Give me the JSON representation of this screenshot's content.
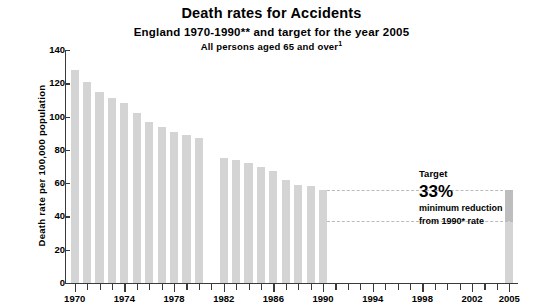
{
  "chart_data": {
    "type": "bar",
    "title": "Death rates for Accidents",
    "subtitle": "England 1970-1990** and target for the year 2005",
    "subtitle2": "All persons aged 65 and over",
    "subtitle2_superscript": "1",
    "xlabel": "",
    "ylabel": "Death rate per 100,000 population",
    "ylim": [
      0,
      140
    ],
    "y_ticks": [
      0,
      20,
      40,
      60,
      80,
      100,
      120,
      140
    ],
    "xlim": [
      1969.3,
      2005.7
    ],
    "x_tick_labels": [
      "1970",
      "1974",
      "1978",
      "1982",
      "1986",
      "1990",
      "1994",
      "1998",
      "2002",
      "2005"
    ],
    "x_tick_label_years": [
      1970,
      1974,
      1978,
      1982,
      1986,
      1990,
      1994,
      1998,
      2002,
      2005
    ],
    "grid": false,
    "legend": "none",
    "bar_color": "#d4d4d4",
    "target_bar_reduction_color": "#bdbdbd",
    "axis_color": "#3a3a3a",
    "dash_color": "#bbbbbb",
    "categories": [
      1970,
      1971,
      1972,
      1973,
      1974,
      1975,
      1976,
      1977,
      1978,
      1979,
      1980,
      1982,
      1983,
      1984,
      1985,
      1986,
      1987,
      1988,
      1989,
      1990,
      2005
    ],
    "values": [
      128,
      121,
      115,
      111,
      108,
      102,
      97,
      94,
      91,
      89,
      87,
      75,
      74,
      72,
      70,
      67,
      62,
      59,
      58,
      56,
      37.5
    ],
    "data_break_after_year": 1980,
    "missing_years": [
      1981
    ],
    "target_year": 2005,
    "target_baseline_year": 1990,
    "target_baseline_value": 56,
    "target_value": 37.5,
    "target_reduction_percent": 33,
    "reference_lines": [
      {
        "name": "1990-rate-line",
        "y": 56,
        "style": "dashed",
        "from_year": 1990,
        "to_year": 2005
      },
      {
        "name": "target-level-line",
        "y": 37.5,
        "style": "dashed",
        "from_year": 1990,
        "to_year": 2005
      }
    ],
    "annotation": {
      "label": "Target",
      "value": "33%",
      "line1": "minimum reduction",
      "line2": "from 1990* rate"
    }
  }
}
